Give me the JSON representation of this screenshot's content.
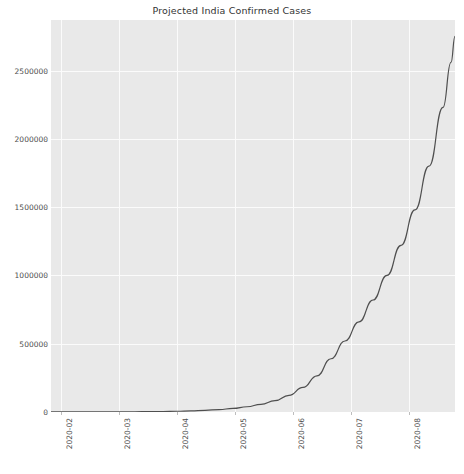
{
  "chart_data": {
    "type": "line",
    "title": "Projected India Confirmed Cases",
    "xlabel": "",
    "ylabel": "",
    "grid": true,
    "legend": null,
    "background": "#e9e9e9",
    "gridline_color": "#fbfbfb",
    "line_color": "#4f4f4f",
    "line_width": 1.2,
    "xlim": [
      "2020-01-22",
      "2020-08-22"
    ],
    "ylim": [
      0,
      2870000
    ],
    "ytick_labels": [
      "0",
      "500000",
      "1000000",
      "1500000",
      "2000000",
      "2500000"
    ],
    "ytick_values": [
      0,
      500000,
      1000000,
      1500000,
      2000000,
      2500000
    ],
    "xtick_labels": [
      "2020-02",
      "2020-03",
      "2020-04",
      "2020-05",
      "2020-06",
      "2020-07",
      "2020-08"
    ],
    "xtick_values": [
      10,
      68,
      126,
      184,
      242,
      300,
      358
    ],
    "series": [
      {
        "name": "Projected India Confirmed Cases",
        "x": [
          0,
          14,
          28,
          42,
          56,
          70,
          84,
          98,
          112,
          126,
          140,
          154,
          168,
          182,
          196,
          210,
          224,
          238,
          252,
          266,
          280,
          294,
          308,
          322,
          336,
          350,
          364,
          378,
          392,
          400,
          404
        ],
        "values": [
          220,
          300,
          420,
          600,
          860,
          1250,
          1800,
          2600,
          3800,
          5600,
          8200,
          12000,
          17700,
          26000,
          38300,
          56400,
          83000,
          122000,
          180000,
          265000,
          390000,
          520000,
          660000,
          820000,
          1000000,
          1220000,
          1480000,
          1800000,
          2230000,
          2560000,
          2750000
        ]
      }
    ],
    "final_value": 2750000,
    "start_value": 220
  },
  "figure": {
    "width": 464,
    "height": 474
  }
}
